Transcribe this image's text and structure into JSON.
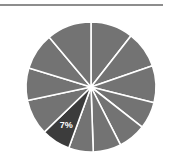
{
  "page": {
    "background_color": "#ffffff",
    "width": 174,
    "height": 166
  },
  "divider": {
    "name": "top-horizontal-rule",
    "color": "#8d8d8d"
  },
  "chart_data": {
    "type": "pie",
    "title": "",
    "subtitle": "",
    "xlabel": "",
    "ylabel": "",
    "legend": [],
    "legend_position": "none",
    "grid": false,
    "center": {
      "x": 91,
      "y": 87
    },
    "radius": 65,
    "start_angle_deg": 0,
    "direction": "clockwise",
    "default_slice_color": "#737373",
    "highlight_slice_color": "#3c3c3c",
    "slice_border_color": "#ffffff",
    "slice_border_width": 1.6,
    "categories": [
      "Slice 1",
      "Slice 2",
      "Slice 3",
      "Slice 4",
      "Slice 5",
      "Slice 6",
      "Slice 7",
      "Slice 8",
      "Slice 9",
      "Slice 10",
      "Slice 11",
      "Slice 12"
    ],
    "values": [
      10,
      9,
      9,
      7,
      7,
      7,
      6,
      7,
      9,
      8,
      9,
      12
    ],
    "slices": [
      {
        "label": "",
        "value": 10,
        "start_deg": 0,
        "end_deg": 38,
        "color": "#737373",
        "highlighted": false,
        "data_label": ""
      },
      {
        "label": "",
        "value": 9,
        "start_deg": 38,
        "end_deg": 71,
        "color": "#737373",
        "highlighted": false,
        "data_label": ""
      },
      {
        "label": "",
        "value": 9,
        "start_deg": 71,
        "end_deg": 104,
        "color": "#737373",
        "highlighted": false,
        "data_label": ""
      },
      {
        "label": "",
        "value": 7,
        "start_deg": 104,
        "end_deg": 128,
        "color": "#737373",
        "highlighted": false,
        "data_label": ""
      },
      {
        "label": "",
        "value": 7,
        "start_deg": 128,
        "end_deg": 153,
        "color": "#737373",
        "highlighted": false,
        "data_label": ""
      },
      {
        "label": "",
        "value": 7,
        "start_deg": 153,
        "end_deg": 178,
        "color": "#737373",
        "highlighted": false,
        "data_label": ""
      },
      {
        "label": "",
        "value": 6,
        "start_deg": 178,
        "end_deg": 200,
        "color": "#737373",
        "highlighted": false,
        "data_label": ""
      },
      {
        "label": "7%",
        "value": 7,
        "start_deg": 200,
        "end_deg": 226,
        "color": "#3c3c3c",
        "highlighted": true,
        "data_label": "7%"
      },
      {
        "label": "",
        "value": 9,
        "start_deg": 226,
        "end_deg": 258,
        "color": "#737373",
        "highlighted": false,
        "data_label": ""
      },
      {
        "label": "",
        "value": 8,
        "start_deg": 258,
        "end_deg": 287,
        "color": "#737373",
        "highlighted": false,
        "data_label": ""
      },
      {
        "label": "",
        "value": 9,
        "start_deg": 287,
        "end_deg": 320,
        "color": "#737373",
        "highlighted": false,
        "data_label": ""
      },
      {
        "label": "",
        "value": 12,
        "start_deg": 320,
        "end_deg": 360,
        "color": "#737373",
        "highlighted": false,
        "data_label": ""
      }
    ],
    "labels_shown": [
      "7%"
    ],
    "label_color": "#ffffff"
  }
}
